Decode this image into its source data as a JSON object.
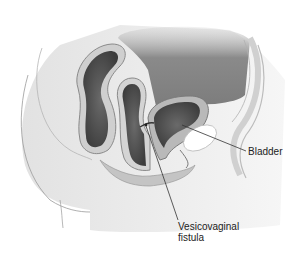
{
  "figure": {
    "type": "anatomical-illustration",
    "view": "sagittal cross-section of female pelvis",
    "colors": {
      "background": "#ffffff",
      "tissue_light": "#ececec",
      "tissue_mid": "#c8c8c8",
      "cavity_dark": "#5a5a5a",
      "abdominal_gray": "#8e8e8e",
      "leader_line": "#333333",
      "label_text": "#222222"
    }
  },
  "labels": {
    "bladder": "Bladder",
    "fistula_line1": "Vesicovaginal",
    "fistula_line2": "fistula"
  }
}
